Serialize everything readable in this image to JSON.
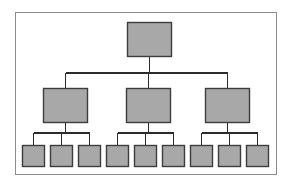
{
  "diagram": {
    "type": "tree",
    "levels": 3,
    "node_count": 13,
    "colors": {
      "background": "#ffffff",
      "frame_border": "#8c8c8c",
      "node_fill": "#a8a8a8",
      "node_border": "#3d3d3d",
      "connector": "#2b2b2b"
    },
    "frame": {
      "x": 15,
      "y": 12,
      "width": 262,
      "height": 163
    },
    "nodes": {
      "root": {
        "label": "",
        "x": 127,
        "y": 22,
        "width": 45,
        "height": 35
      },
      "branches": [
        {
          "label": "",
          "x": 43,
          "y": 88,
          "width": 45,
          "height": 35
        },
        {
          "label": "",
          "x": 126,
          "y": 88,
          "width": 45,
          "height": 35
        },
        {
          "label": "",
          "x": 205,
          "y": 88,
          "width": 45,
          "height": 35
        }
      ],
      "leaves": [
        {
          "label": "",
          "x": 22,
          "y": 145,
          "width": 23,
          "height": 22
        },
        {
          "label": "",
          "x": 50,
          "y": 145,
          "width": 23,
          "height": 22
        },
        {
          "label": "",
          "x": 78,
          "y": 145,
          "width": 23,
          "height": 22
        },
        {
          "label": "",
          "x": 106,
          "y": 145,
          "width": 23,
          "height": 22
        },
        {
          "label": "",
          "x": 134,
          "y": 145,
          "width": 23,
          "height": 22
        },
        {
          "label": "",
          "x": 162,
          "y": 145,
          "width": 23,
          "height": 22
        },
        {
          "label": "",
          "x": 190,
          "y": 145,
          "width": 23,
          "height": 22
        },
        {
          "label": "",
          "x": 218,
          "y": 145,
          "width": 23,
          "height": 22
        },
        {
          "label": "",
          "x": 246,
          "y": 145,
          "width": 23,
          "height": 22
        }
      ]
    },
    "connectors": {
      "root_bus_y": 73,
      "leaf_bus_y": 133,
      "root_stem_from": 57,
      "branch_stem_to": 88,
      "branch_stem_from": 123,
      "leaf_stem_to": 145
    }
  }
}
